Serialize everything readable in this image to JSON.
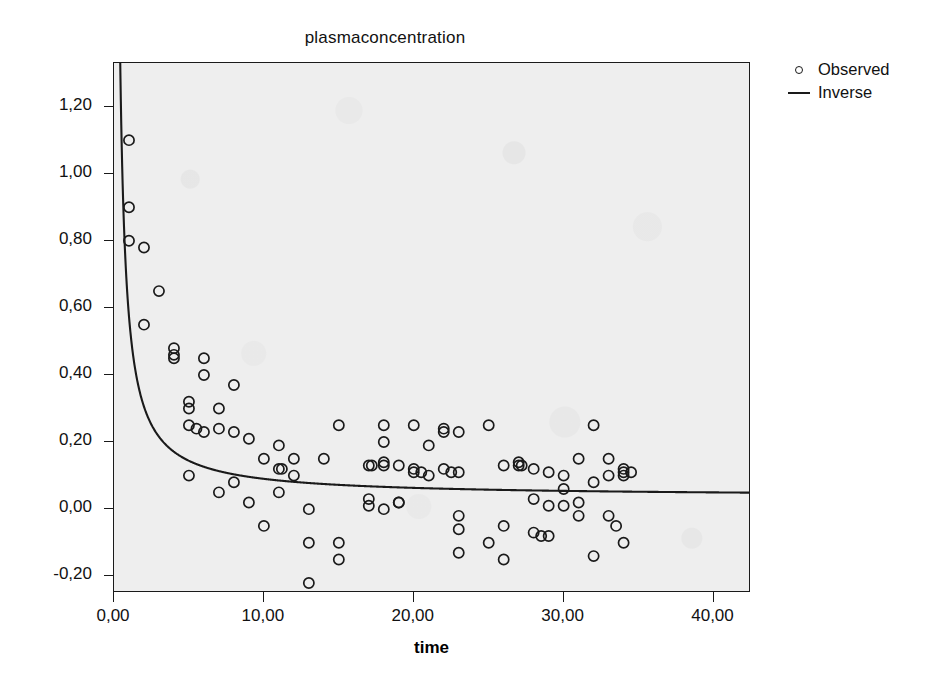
{
  "chart_data": {
    "type": "scatter",
    "title": "plasmaconcentration",
    "xlabel": "time",
    "ylabel": "",
    "xlim": [
      0,
      42.5
    ],
    "ylim": [
      -0.25,
      1.33
    ],
    "grid": false,
    "legend_position": "right",
    "x_ticks": [
      "0,00",
      "10,00",
      "20,00",
      "30,00",
      "40,00"
    ],
    "x_tick_values": [
      0,
      10,
      20,
      30,
      40
    ],
    "y_ticks": [
      "-0,20",
      "0,00",
      "0,20",
      "0,40",
      "0,60",
      "0,80",
      "1,00",
      "1,20"
    ],
    "y_tick_values": [
      -0.2,
      0,
      0.2,
      0.4,
      0.6,
      0.8,
      1.0,
      1.2
    ],
    "decimal_separator": ",",
    "series": [
      {
        "name": "Observed",
        "type": "scatter",
        "marker": "open-circle",
        "color": "#1a1a1a",
        "points": [
          [
            1.0,
            1.1
          ],
          [
            1.0,
            0.9
          ],
          [
            1.0,
            0.8
          ],
          [
            2.0,
            0.78
          ],
          [
            3.0,
            0.65
          ],
          [
            2.0,
            0.55
          ],
          [
            4.0,
            0.48
          ],
          [
            4.0,
            0.46
          ],
          [
            4.0,
            0.45
          ],
          [
            5.0,
            0.32
          ],
          [
            6.0,
            0.45
          ],
          [
            6.0,
            0.4
          ],
          [
            7.0,
            0.3
          ],
          [
            8.0,
            0.37
          ],
          [
            5.0,
            0.3
          ],
          [
            5.0,
            0.25
          ],
          [
            6.0,
            0.23
          ],
          [
            8.0,
            0.23
          ],
          [
            9.0,
            0.21
          ],
          [
            11.0,
            0.19
          ],
          [
            7.0,
            0.24
          ],
          [
            5.5,
            0.24
          ],
          [
            10.0,
            0.15
          ],
          [
            12.0,
            0.15
          ],
          [
            14.0,
            0.15
          ],
          [
            11.0,
            0.12
          ],
          [
            11.2,
            0.12
          ],
          [
            12.0,
            0.1
          ],
          [
            5.0,
            0.1
          ],
          [
            8.0,
            0.08
          ],
          [
            7.0,
            0.05
          ],
          [
            9.0,
            0.02
          ],
          [
            10.0,
            -0.05
          ],
          [
            11.0,
            0.05
          ],
          [
            13.0,
            -0.1
          ],
          [
            13.0,
            -0.22
          ],
          [
            13.0,
            0.0
          ],
          [
            15.0,
            -0.1
          ],
          [
            15.0,
            -0.15
          ],
          [
            15.0,
            0.25
          ],
          [
            17.0,
            0.13
          ],
          [
            17.2,
            0.13
          ],
          [
            18.0,
            0.14
          ],
          [
            18.0,
            0.13
          ],
          [
            18.0,
            0.2
          ],
          [
            18.0,
            0.25
          ],
          [
            19.0,
            0.13
          ],
          [
            19.0,
            0.02
          ],
          [
            20.0,
            0.12
          ],
          [
            20.0,
            0.11
          ],
          [
            20.5,
            0.11
          ],
          [
            21.0,
            0.19
          ],
          [
            21.0,
            0.1
          ],
          [
            22.0,
            0.23
          ],
          [
            22.0,
            0.24
          ],
          [
            22.0,
            0.12
          ],
          [
            22.5,
            0.11
          ],
          [
            23.0,
            0.23
          ],
          [
            23.0,
            0.11
          ],
          [
            17.0,
            0.03
          ],
          [
            17.0,
            0.01
          ],
          [
            18.0,
            0.0
          ],
          [
            19.0,
            0.02
          ],
          [
            23.0,
            -0.02
          ],
          [
            23.0,
            -0.06
          ],
          [
            23.0,
            -0.13
          ],
          [
            25.0,
            0.25
          ],
          [
            25.0,
            -0.1
          ],
          [
            26.0,
            -0.05
          ],
          [
            26.0,
            0.13
          ],
          [
            27.0,
            0.14
          ],
          [
            27.0,
            0.13
          ],
          [
            27.2,
            0.13
          ],
          [
            26.0,
            -0.15
          ],
          [
            28.0,
            0.12
          ],
          [
            28.0,
            0.03
          ],
          [
            28.0,
            -0.07
          ],
          [
            28.5,
            -0.08
          ],
          [
            29.0,
            0.11
          ],
          [
            29.0,
            0.01
          ],
          [
            29.0,
            -0.08
          ],
          [
            30.0,
            0.06
          ],
          [
            30.0,
            0.1
          ],
          [
            30.0,
            0.01
          ],
          [
            31.0,
            0.15
          ],
          [
            31.0,
            0.02
          ],
          [
            31.0,
            -0.02
          ],
          [
            32.0,
            0.25
          ],
          [
            32.0,
            0.08
          ],
          [
            32.0,
            -0.14
          ],
          [
            33.0,
            0.15
          ],
          [
            33.0,
            0.1
          ],
          [
            33.0,
            -0.02
          ],
          [
            34.0,
            0.12
          ],
          [
            34.0,
            0.11
          ],
          [
            34.0,
            0.1
          ],
          [
            34.5,
            0.11
          ],
          [
            33.5,
            -0.05
          ],
          [
            34.0,
            -0.1
          ],
          [
            20.0,
            0.25
          ]
        ]
      },
      {
        "name": "Inverse",
        "type": "line",
        "color": "#1a1a1a",
        "equation": "y = b0 + b1 / x",
        "b0": 0.0365,
        "b1": 0.538
      }
    ],
    "legend_entries": [
      {
        "label": "Observed",
        "key": "open-circle"
      },
      {
        "label": "Inverse",
        "key": "line"
      }
    ]
  },
  "axes": {
    "title": "plasmaconcentration",
    "x_label": "time"
  },
  "legend": {
    "observed_label": "Observed",
    "inverse_label": "Inverse"
  }
}
